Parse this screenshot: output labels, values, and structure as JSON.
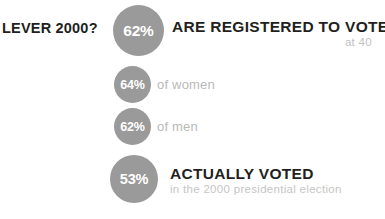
{
  "meta": {
    "background_color": "#ffffff",
    "circle_color": "#9a9a9a",
    "headline_color": "#231f20",
    "muted_color": "#bdbdbd"
  },
  "lever": {
    "label": "LEVER 2000?"
  },
  "registered": {
    "percent": "62%",
    "headline": "ARE REGISTERED TO VOTE",
    "subline": "at 40"
  },
  "women": {
    "percent": "64%",
    "label": "of women"
  },
  "men": {
    "percent": "62%",
    "label": "of men"
  },
  "voted": {
    "percent": "53%",
    "headline": "ACTUALLY VOTED",
    "subline": "in the 2000 presidential election"
  },
  "chart_data": {
    "type": "bar",
    "categories": [
      "Registered to vote (all, at 40)",
      "Registered to vote (women)",
      "Registered to vote (men)",
      "Actually voted (2000 presidential election)"
    ],
    "values": [
      62,
      64,
      62,
      53
    ],
    "value_labels": [
      "62%",
      "64%",
      "62%",
      "53%"
    ],
    "xlabel": "",
    "ylabel": "Percent",
    "ylim": [
      0,
      100
    ],
    "grid": false,
    "legend": "none",
    "annotations": [
      "at 40",
      "of women",
      "of men",
      "in the 2000 presidential election"
    ]
  }
}
